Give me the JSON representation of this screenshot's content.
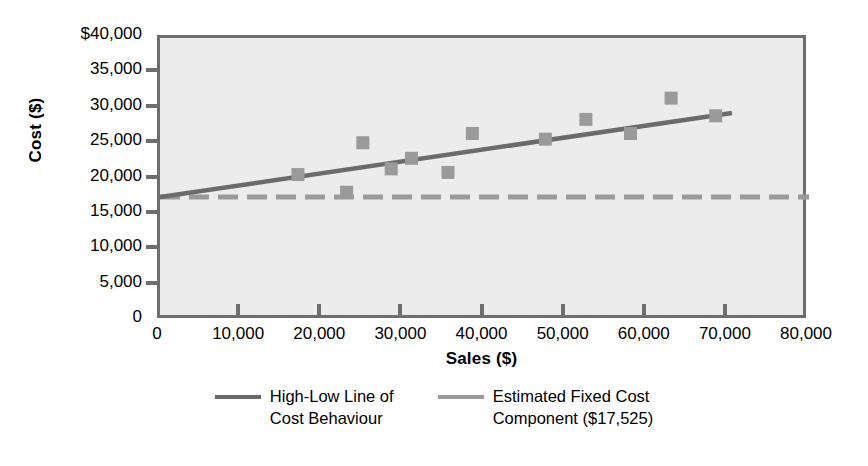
{
  "chart_data": {
    "type": "scatter",
    "title": "",
    "xlabel": "Sales ($)",
    "ylabel": "Cost ($)",
    "xlim": [
      0,
      80000
    ],
    "ylim": [
      0,
      40000
    ],
    "xticks": [
      "0",
      "10,000",
      "20,000",
      "30,000",
      "40,000",
      "50,000",
      "60,000",
      "70,000",
      "80,000"
    ],
    "xtick_values": [
      0,
      10000,
      20000,
      30000,
      40000,
      50000,
      60000,
      70000,
      80000
    ],
    "yticks": [
      "0",
      "5,000",
      "10,000",
      "15,000",
      "20,000",
      "25,000",
      "30,000",
      "35,000",
      "$40,000"
    ],
    "ytick_values": [
      0,
      5000,
      10000,
      15000,
      20000,
      25000,
      30000,
      35000,
      40000
    ],
    "grid": false,
    "plot_background": "#ececec",
    "legend_position": "bottom",
    "series": [
      {
        "name": "Data Points",
        "type": "scatter",
        "marker": "square",
        "color": "#9a9a9a",
        "points": [
          {
            "x": 17000,
            "y": 20700
          },
          {
            "x": 23000,
            "y": 18200
          },
          {
            "x": 25000,
            "y": 25200
          },
          {
            "x": 28500,
            "y": 21500
          },
          {
            "x": 31000,
            "y": 23000
          },
          {
            "x": 35500,
            "y": 21000
          },
          {
            "x": 38500,
            "y": 26500
          },
          {
            "x": 47500,
            "y": 25700
          },
          {
            "x": 52500,
            "y": 28500
          },
          {
            "x": 58000,
            "y": 26500
          },
          {
            "x": 63000,
            "y": 31500
          },
          {
            "x": 68500,
            "y": 29000
          }
        ]
      },
      {
        "name": "High-Low Line of Cost Behaviour",
        "type": "line",
        "style": "solid",
        "color": "#6b6b6b",
        "x": [
          0,
          70500
        ],
        "y": [
          17525,
          29400
        ]
      },
      {
        "name": "Estimated Fixed Cost Component ($17,525)",
        "type": "line",
        "style": "dashed",
        "color": "#9a9a9a",
        "value": 17525,
        "x": [
          0,
          80000
        ],
        "y": [
          17525,
          17525
        ]
      }
    ],
    "legend": [
      {
        "label": "High-Low Line of\nCost Behaviour",
        "style": "solid",
        "color": "#6b6b6b"
      },
      {
        "label": "Estimated Fixed Cost\nComponent ($17,525)",
        "style": "dashed",
        "color": "#9a9a9a"
      }
    ]
  },
  "axes": {
    "y_title": "Cost ($)",
    "x_title": "Sales ($)"
  },
  "colors": {
    "marker": "#9a9a9a",
    "solid_line": "#6b6b6b",
    "dashed_line": "#9a9a9a",
    "plot_bg": "#ececec",
    "axis": "#6e6e6e"
  }
}
